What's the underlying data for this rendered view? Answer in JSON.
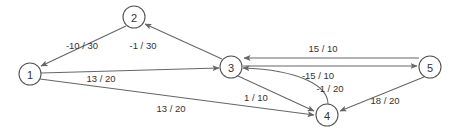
{
  "diagram": {
    "type": "directed-graph",
    "title": "",
    "label_format": "cost / capacity",
    "stroke_color": "#666666",
    "node_stroke_color": "#555555",
    "text_color": "#333333",
    "background_color": "#ffffff",
    "nodes": [
      {
        "id": "1",
        "label": "1",
        "cx": 30,
        "cy": 74,
        "r": 11
      },
      {
        "id": "2",
        "label": "2",
        "cx": 134,
        "cy": 17,
        "r": 11
      },
      {
        "id": "3",
        "label": "3",
        "cx": 231,
        "cy": 67,
        "r": 11
      },
      {
        "id": "4",
        "label": "4",
        "cx": 327,
        "cy": 115,
        "r": 11
      },
      {
        "id": "5",
        "label": "5",
        "cx": 430,
        "cy": 67,
        "r": 11
      }
    ],
    "edges": [
      {
        "id": "e2-1",
        "from": "2",
        "to": "1",
        "label": "-10 / 30",
        "label_x": 82,
        "label_y": 45
      },
      {
        "id": "e3-2",
        "from": "3",
        "to": "2",
        "label": "-1 / 30",
        "label_x": 143,
        "label_y": 45
      },
      {
        "id": "e1-3",
        "from": "1",
        "to": "3",
        "label": "13 / 20",
        "label_x": 101,
        "label_y": 78
      },
      {
        "id": "e1-4",
        "from": "1",
        "to": "4",
        "label": "13 / 20",
        "label_x": 171,
        "label_y": 108
      },
      {
        "id": "e5-3",
        "from": "5",
        "to": "3",
        "label": "15 / 10",
        "label_x": 323,
        "label_y": 48
      },
      {
        "id": "e3-5",
        "from": "3",
        "to": "5",
        "label": "-15 / 10",
        "label_x": 318,
        "label_y": 75
      },
      {
        "id": "e4-3",
        "from": "4",
        "to": "3",
        "label": "-1 / 20",
        "label_x": 330,
        "label_y": 88
      },
      {
        "id": "e3-4",
        "from": "3",
        "to": "4",
        "label": "1 / 10",
        "label_x": 256,
        "label_y": 97
      },
      {
        "id": "e5-4",
        "from": "5",
        "to": "4",
        "label": "18 / 20",
        "label_x": 385,
        "label_y": 100
      }
    ]
  }
}
